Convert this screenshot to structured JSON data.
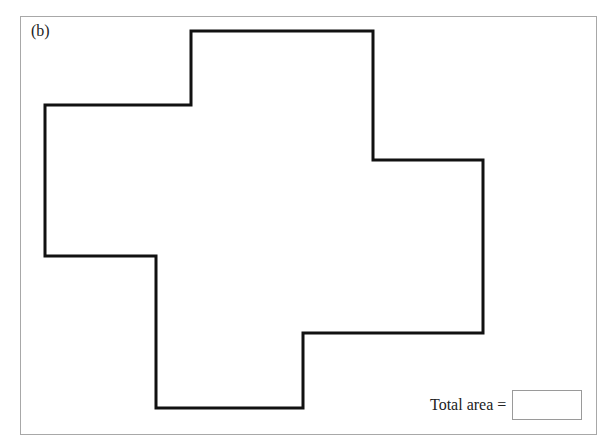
{
  "figure": {
    "part_label": "(b)",
    "frame_color": "#a8a8a8",
    "shape": {
      "type": "rectilinear-polygon",
      "stroke_color": "#111111",
      "stroke_width": 3,
      "points": "191,31 373,31 373,160 483,160 483,333 303,333 303,408 156,408 156,256 45,256 45,105 191,105"
    }
  },
  "answer": {
    "label": "Total area =",
    "value": "",
    "placeholder": ""
  }
}
